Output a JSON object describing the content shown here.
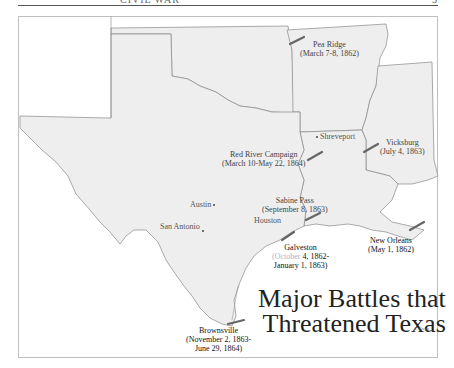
{
  "page": {
    "header_text": "CIVIL WAR",
    "page_number": "5"
  },
  "map": {
    "title_line1": "Major Battles that",
    "title_line2": "Threatened Texas",
    "credit": "C. Gregg",
    "colors": {
      "land": "#eeeeee",
      "border": "#888888",
      "battle_marker": "#666666",
      "background": "#ffffff"
    },
    "cities": [
      {
        "name": "Shreveport"
      },
      {
        "name": "Austin"
      },
      {
        "name": "San Antonio"
      },
      {
        "name": "Houston"
      }
    ],
    "battles": [
      {
        "name": "Pea Ridge",
        "dates": "(March 7-8, 1862)"
      },
      {
        "name": "Vicksburg",
        "dates": "(July 4, 1863)"
      },
      {
        "name": "Red River Campaign",
        "dates": "(March 10-May 22, 1864)"
      },
      {
        "name": "Sabine Pass",
        "dates": "(September 8, 1863)"
      },
      {
        "name": "Galveston",
        "dates_a": "(October",
        "dates_b": " 4, 1862-",
        "dates_c": "January 1, 1863)"
      },
      {
        "name": "New Orleans",
        "dates": "(May 1, 1862)"
      },
      {
        "name": "Brownsville",
        "dates_a": "(November 2, 1863-",
        "dates_b": "June 29, 1864)"
      }
    ]
  }
}
